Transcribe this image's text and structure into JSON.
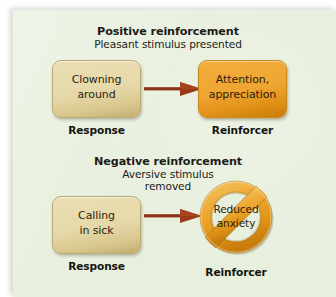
{
  "figure": {
    "panel_color": "#e7efdd",
    "page_background": "#ffffff",
    "arrow_color": "#8e3318",
    "box_tan_color": "#e8dcae",
    "box_orange_color": "#efa531",
    "ring_color": "#efa531"
  },
  "sections": [
    {
      "id": "positive",
      "title": "Positive reinforcement",
      "subtitle_lines": [
        "Pleasant stimulus presented"
      ],
      "response": {
        "label": "Response",
        "box_lines": [
          "Clowning",
          "around"
        ],
        "box_style": "tan"
      },
      "reinforcer": {
        "label": "Reinforcer",
        "box_lines": [
          "Attention,",
          "appreciation"
        ],
        "box_style": "orange",
        "shape": "rounded-rect"
      },
      "arrow": {
        "direction": "right",
        "icon": "arrow-right-icon"
      }
    },
    {
      "id": "negative",
      "title": "Negative reinforcement",
      "subtitle_lines": [
        "Aversive stimulus",
        "removed"
      ],
      "response": {
        "label": "Response",
        "box_lines": [
          "Calling",
          "in sick"
        ],
        "box_style": "tan"
      },
      "reinforcer": {
        "label": "Reinforcer",
        "box_lines": [
          "Reduced",
          "anxiety"
        ],
        "box_style": "ring",
        "shape": "prohibition-ring"
      },
      "arrow": {
        "direction": "right",
        "icon": "arrow-right-icon"
      }
    }
  ]
}
